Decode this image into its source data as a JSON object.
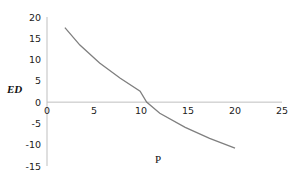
{
  "chart_data": {
    "type": "line",
    "title": "",
    "xlabel": "P",
    "ylabel": "ED",
    "xlim": [
      0,
      25
    ],
    "ylim": [
      -15,
      20
    ],
    "x_ticks": [
      0,
      5,
      10,
      15,
      20,
      25
    ],
    "y_ticks": [
      20,
      15,
      10,
      5,
      0,
      -5,
      -10,
      -15
    ],
    "grid": false,
    "legend": null,
    "series": [
      {
        "name": "ED",
        "color": "#7f7f7f",
        "x": [
          1.9,
          3.5,
          5.6,
          7.8,
          9.9,
          10.6,
          12.0,
          14.7,
          17.3,
          20.0
        ],
        "y": [
          17.5,
          13.4,
          9.2,
          5.6,
          2.6,
          0.0,
          -2.6,
          -5.9,
          -8.5,
          -10.8
        ]
      }
    ]
  }
}
